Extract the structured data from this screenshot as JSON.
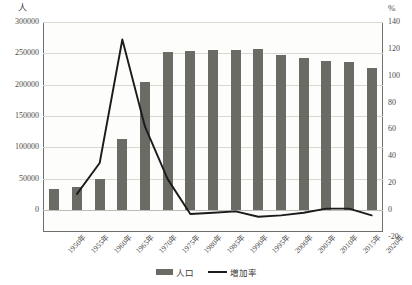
{
  "chart_data": {
    "type": "bar",
    "title": "",
    "subtitle": "",
    "xlabel": "",
    "ylabel": "人",
    "y2label": "%",
    "grid": true,
    "legend_position": "bottom",
    "ylim": [
      0,
      300000
    ],
    "y2lim": [
      -20,
      140
    ],
    "yticks": [
      "0",
      "50000",
      "100000",
      "150000",
      "200000",
      "250000",
      "300000"
    ],
    "ytick_values": [
      0,
      50000,
      100000,
      150000,
      200000,
      250000,
      300000
    ],
    "y2ticks": [
      "-20",
      "0",
      "20",
      "40",
      "60",
      "80",
      "100",
      "120",
      "140"
    ],
    "y2tick_values": [
      -20,
      0,
      20,
      40,
      60,
      80,
      100,
      120,
      140
    ],
    "categories": [
      "1950年",
      "1955年",
      "1960年",
      "1965年",
      "1970年",
      "1975年",
      "1980年",
      "1985年",
      "1990年",
      "1995年",
      "2000年",
      "2005年",
      "2010年",
      "2015年",
      "2020年"
    ],
    "series": [
      {
        "name": "人口",
        "type": "bar",
        "axis": "left",
        "color": "#6b6b66",
        "values": [
          33000,
          37000,
          50000,
          113000,
          205000,
          252000,
          253000,
          256000,
          255000,
          257000,
          248000,
          242000,
          237000,
          236000,
          227000
        ]
      },
      {
        "name": "増加率",
        "type": "line",
        "axis": "right",
        "color": "#1b1b1b",
        "values": [
          null,
          12,
          35,
          127,
          62,
          23,
          -3,
          -2,
          -1,
          -5,
          -4,
          -2,
          1,
          1,
          -4
        ]
      }
    ]
  },
  "legend": {
    "items": [
      {
        "label": "人口",
        "marker": "bar-swatch"
      },
      {
        "label": "増加率",
        "marker": "line-swatch"
      }
    ]
  },
  "axes": {
    "left_unit": "人",
    "right_unit": "%"
  }
}
